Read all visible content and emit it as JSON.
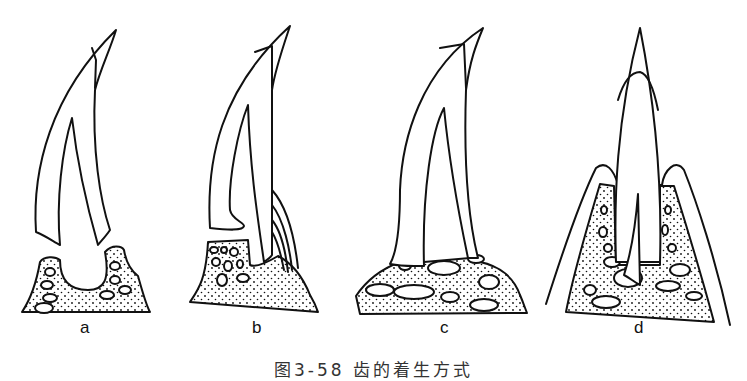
{
  "figure": {
    "panels": [
      {
        "id": "a",
        "label": "a",
        "description": "Tooth resting on bone socket, detached base (acrodont-like, separate)"
      },
      {
        "id": "b",
        "label": "b",
        "description": "Tooth attached to side of jaw bone with ligament fibers (pleurodont)"
      },
      {
        "id": "c",
        "label": "c",
        "description": "Tooth fused onto top of bone (acrodont)"
      },
      {
        "id": "d",
        "label": "d",
        "description": "Tooth set in socket with surrounding gum tissue (thecodont)"
      }
    ],
    "caption": "图3-58 齿的着生方式"
  }
}
